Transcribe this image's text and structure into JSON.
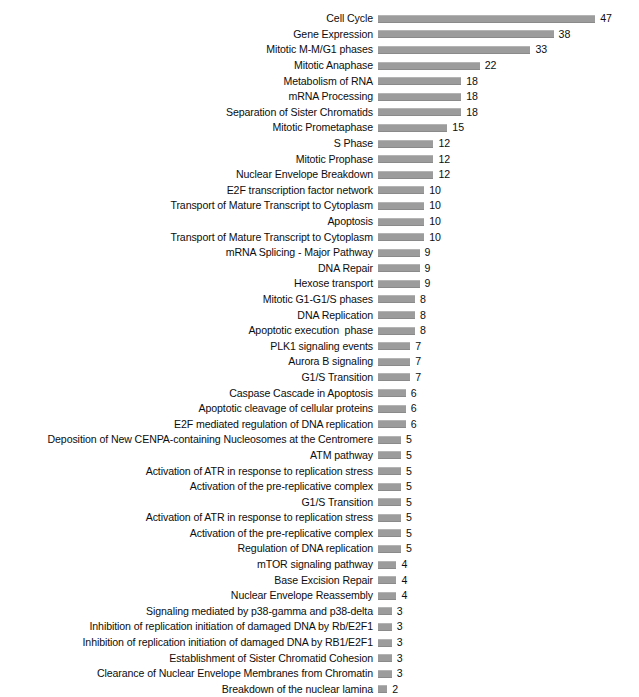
{
  "chart_data": {
    "type": "bar",
    "orientation": "horizontal",
    "title": "",
    "subtitle": "",
    "xlabel": "",
    "ylabel": "",
    "legend": [],
    "grid": false,
    "xlim": [
      0,
      47
    ],
    "bar_color": "#9c9c9c",
    "text_color": "#0d0d0d",
    "background_color": "#ffffff",
    "value_labels_shown": true,
    "categories": [
      "Cell Cycle",
      "Gene Expression",
      "Mitotic M-M/G1 phases",
      "Mitotic Anaphase",
      "Metabolism of RNA",
      "mRNA Processing",
      "Separation of Sister Chromatids",
      "Mitotic Prometaphase",
      "S Phase",
      "Mitotic Prophase",
      "Nuclear Envelope Breakdown",
      "E2F transcription factor network",
      "Transport of Mature Transcript to Cytoplasm",
      "Apoptosis",
      "Transport of Mature Transcript to Cytoplasm",
      "mRNA Splicing - Major Pathway",
      "DNA Repair",
      "Hexose transport",
      "Mitotic G1-G1/S phases",
      "DNA Replication",
      "Apoptotic execution  phase",
      "PLK1 signaling events",
      "Aurora B signaling",
      "G1/S Transition",
      "Caspase Cascade in Apoptosis",
      "Apoptotic cleavage of cellular proteins",
      "E2F mediated regulation of DNA replication",
      "Deposition of New CENPA-containing Nucleosomes at the Centromere",
      "ATM pathway",
      "Activation of ATR in response to replication stress",
      "Activation of the pre-replicative complex",
      "G1/S Transition",
      "Activation of ATR in response to replication stress",
      "Activation of the pre-replicative complex",
      "Regulation of DNA replication",
      "mTOR signaling pathway",
      "Base Excision Repair",
      "Nuclear Envelope Reassembly",
      "Signaling mediated by p38-gamma and p38-delta",
      "Inhibition of replication initiation of damaged DNA by Rb/E2F1",
      "Inhibition of replication initiation of damaged DNA by RB1/E2F1",
      "Establishment of Sister Chromatid Cohesion",
      "Clearance of Nuclear Envelope Membranes from Chromatin",
      "Breakdown of the nuclear lamina"
    ],
    "values": [
      47,
      38,
      33,
      22,
      18,
      18,
      18,
      15,
      12,
      12,
      12,
      10,
      10,
      10,
      10,
      9,
      9,
      9,
      8,
      8,
      8,
      7,
      7,
      7,
      6,
      6,
      6,
      5,
      5,
      5,
      5,
      5,
      5,
      5,
      5,
      4,
      4,
      4,
      3,
      3,
      3,
      3,
      3,
      2
    ]
  }
}
